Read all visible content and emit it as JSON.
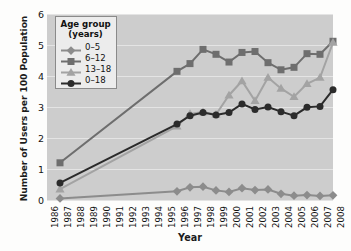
{
  "chart_data": {
    "type": "line",
    "title": "",
    "xlabel": "Year",
    "ylabel": "Number of Users per 100 Population",
    "xlim": [
      1986,
      2008
    ],
    "ylim": [
      0,
      6
    ],
    "yticks": [
      0,
      1,
      2,
      3,
      4,
      5,
      6
    ],
    "grid": true,
    "legend_position": "top-left",
    "legend_title_line1": "Age group",
    "legend_title_line2": "(years)",
    "x": [
      1986,
      1987,
      1988,
      1989,
      1990,
      1991,
      1992,
      1993,
      1994,
      1995,
      1996,
      1997,
      1998,
      1999,
      2000,
      2001,
      2002,
      2003,
      2004,
      2005,
      2006,
      2007,
      2008
    ],
    "xtick_labels": [
      "1986",
      "1987",
      "1988",
      "1989",
      "1990",
      "1991",
      "1992",
      "1993",
      "1994",
      "1995",
      "1996",
      "1997",
      "1998",
      "1999",
      "2000",
      "2001",
      "2002",
      "2003",
      "2004",
      "2005",
      "2006",
      "2007",
      "2008"
    ],
    "series": [
      {
        "name": "0–5",
        "marker": "diamond",
        "color": "#8c8c8c",
        "x": [
          1987,
          1996,
          1997,
          1998,
          1999,
          2000,
          2001,
          2002,
          2003,
          2004,
          2005,
          2006,
          2007,
          2008
        ],
        "values": [
          0.05,
          0.28,
          0.41,
          0.43,
          0.31,
          0.26,
          0.38,
          0.32,
          0.34,
          0.2,
          0.14,
          0.16,
          0.13,
          0.15
        ]
      },
      {
        "name": "6–12",
        "marker": "square",
        "color": "#6e6e6e",
        "x": [
          1987,
          1996,
          1997,
          1998,
          1999,
          2000,
          2001,
          2002,
          2003,
          2004,
          2005,
          2006,
          2007,
          2008
        ],
        "values": [
          1.2,
          4.15,
          4.4,
          4.86,
          4.7,
          4.45,
          4.76,
          4.79,
          4.43,
          4.2,
          4.28,
          4.72,
          4.7,
          5.12
        ]
      },
      {
        "name": "13–18",
        "marker": "triangle",
        "color": "#a3a3a3",
        "x": [
          1987,
          1996,
          1997,
          1998,
          1999,
          2000,
          2001,
          2002,
          2003,
          2004,
          2005,
          2006,
          2007,
          2008
        ],
        "values": [
          0.35,
          2.38,
          2.78,
          2.84,
          2.76,
          3.38,
          3.84,
          3.2,
          3.95,
          3.6,
          3.33,
          3.75,
          3.95,
          5.08
        ]
      },
      {
        "name": "0–18",
        "marker": "circle",
        "color": "#2b2b2b",
        "x": [
          1987,
          1996,
          1997,
          1998,
          1999,
          2000,
          2001,
          2002,
          2003,
          2004,
          2005,
          2006,
          2007,
          2008
        ],
        "values": [
          0.55,
          2.45,
          2.72,
          2.82,
          2.74,
          2.82,
          3.1,
          2.92,
          3.0,
          2.85,
          2.72,
          2.99,
          3.02,
          3.56
        ]
      }
    ]
  }
}
